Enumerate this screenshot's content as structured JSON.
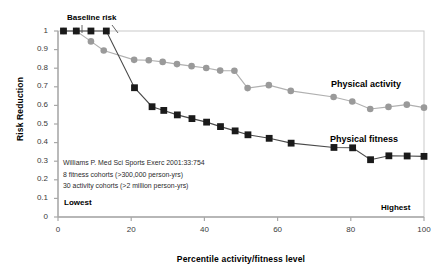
{
  "chart_data": {
    "type": "line",
    "title": "",
    "xlabel": "Percentile activity/fitness level",
    "ylabel": "Risk Reduction",
    "xlim": [
      0,
      100
    ],
    "ylim": [
      0,
      1
    ],
    "xticks": [
      "0",
      "20",
      "40",
      "60",
      "80",
      "100"
    ],
    "xtick_values": [
      0,
      20,
      40,
      60,
      80,
      100
    ],
    "yticks": [
      "0",
      "0.1",
      "0.2",
      "0.3",
      "0.4",
      "0.5",
      "0.6",
      "0.7",
      "0.8",
      "0.9",
      "1"
    ],
    "ytick_values": [
      0,
      0.1,
      0.2,
      0.3,
      0.4,
      0.5,
      0.6,
      0.7,
      0.8,
      0.9,
      1
    ],
    "grid": false,
    "legend_position": "inline-right",
    "series": [
      {
        "name": "Physical activity",
        "marker": "circle",
        "color": "#9a9a9a",
        "line_color": "#b0b0b0",
        "points": [
          [
            1.5,
            1.0
          ],
          [
            5.0,
            1.0
          ],
          [
            9.0,
            0.944
          ],
          [
            12.5,
            0.895
          ],
          [
            20.8,
            0.845
          ],
          [
            24.8,
            0.843
          ],
          [
            28.6,
            0.834
          ],
          [
            32.5,
            0.822
          ],
          [
            36.5,
            0.811
          ],
          [
            40.5,
            0.801
          ],
          [
            44.3,
            0.787
          ],
          [
            48.2,
            0.786
          ],
          [
            51.8,
            0.693
          ],
          [
            57.6,
            0.709
          ],
          [
            63.6,
            0.678
          ],
          [
            75.3,
            0.645
          ],
          [
            80.4,
            0.621
          ],
          [
            85.3,
            0.581
          ],
          [
            90.3,
            0.592
          ],
          [
            95.3,
            0.604
          ],
          [
            100.0,
            0.588
          ]
        ]
      },
      {
        "name": "Physical fitness",
        "marker": "square",
        "color": "#1a1a1a",
        "line_color": "#4a4a4a",
        "points": [
          [
            1.5,
            1.0
          ],
          [
            5.0,
            1.0
          ],
          [
            9.0,
            1.0
          ],
          [
            13.2,
            1.0
          ],
          [
            20.9,
            0.695
          ],
          [
            25.7,
            0.593
          ],
          [
            28.9,
            0.573
          ],
          [
            32.6,
            0.549
          ],
          [
            36.6,
            0.529
          ],
          [
            40.6,
            0.51
          ],
          [
            44.4,
            0.486
          ],
          [
            48.4,
            0.463
          ],
          [
            51.9,
            0.442
          ],
          [
            57.7,
            0.423
          ],
          [
            63.7,
            0.397
          ],
          [
            75.4,
            0.374
          ],
          [
            80.5,
            0.372
          ],
          [
            85.4,
            0.308
          ],
          [
            90.4,
            0.329
          ],
          [
            95.4,
            0.328
          ],
          [
            100.0,
            0.326
          ]
        ]
      }
    ],
    "annotations": [
      {
        "id": "baseline-risk",
        "text": "Baseline risk"
      },
      {
        "id": "lowest",
        "text": "Lowest"
      },
      {
        "id": "highest",
        "text": "Highest"
      }
    ],
    "citation": [
      "Williams P. Med Sci Sports Exerc 2001:33:754",
      "8 fitness cohorts (>300,000 person-yrs)",
      "30 activity cohorts (>2 million person-yrs)"
    ]
  },
  "colors": {
    "activity": "#9a9a9a",
    "fitness": "#1a1a1a",
    "axis": "#b8b8b8",
    "text": "#1a1a1a"
  }
}
